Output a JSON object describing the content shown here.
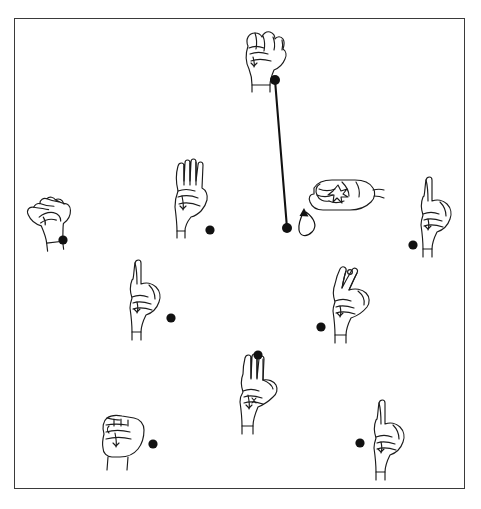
{
  "figure": {
    "header_caption": "",
    "frame": {
      "x": 14,
      "y": 18,
      "width": 451,
      "height": 471,
      "border_color": "#3a3a3a",
      "background": "#ffffff"
    },
    "canvas": {
      "width": 481,
      "height": 509
    },
    "ink_color": "#1b1b1b",
    "dot_color": "#111111",
    "chart_type": "diagram"
  },
  "handshapes": [
    {
      "id": "hand-top-fist",
      "label": "fist-handshape-top",
      "description": "closed fist, fingers curled, thumb across front, palm facing left",
      "shape": "fist",
      "x": 262,
      "y": 52,
      "rotation": 0,
      "dot": {
        "x": 275,
        "y": 80,
        "r": 5.0
      }
    },
    {
      "id": "hand-left-claw",
      "label": "claw-handshape-left",
      "description": "bent curved hand, fingers together and curled forward",
      "shape": "claw",
      "x": 52,
      "y": 215,
      "rotation": -14,
      "dot": {
        "x": 63,
        "y": 240,
        "r": 4.6
      }
    },
    {
      "id": "hand-upper-left-flat",
      "label": "flat-handshape-upper-left",
      "description": "flat open hand, four fingers extended upward, thumb folded in",
      "shape": "flat-b",
      "x": 191,
      "y": 193,
      "rotation": 0,
      "dot": {
        "x": 210,
        "y": 230,
        "r": 4.6
      }
    },
    {
      "id": "hand-right-twist",
      "label": "twisting-handshape-right",
      "description": "horizontal hand with curved rotation arrow and contact star marker",
      "shape": "twist-horizontal",
      "x": 336,
      "y": 192,
      "rotation": 0,
      "dot": null,
      "motion_arrow": true,
      "contact_marker": true
    },
    {
      "id": "hand-right-index",
      "label": "index-handshape-right",
      "description": "index finger extended upward, remaining fingers closed",
      "shape": "index-up",
      "x": 437,
      "y": 215,
      "rotation": 0,
      "dot": {
        "x": 413,
        "y": 245,
        "r": 4.6
      }
    },
    {
      "id": "hand-mid-left-index",
      "label": "index-handshape-mid-left",
      "description": "index finger extended upward, remaining fingers closed",
      "shape": "index-up",
      "x": 146,
      "y": 298,
      "rotation": 0,
      "dot": {
        "x": 171,
        "y": 318,
        "r": 4.6
      }
    },
    {
      "id": "hand-mid-right-two",
      "label": "two-finger-handshape-mid-right",
      "description": "index and middle fingers extended and spread, thumb out",
      "shape": "two-finger",
      "x": 351,
      "y": 300,
      "rotation": 0,
      "dot": {
        "x": 321,
        "y": 327,
        "r": 4.6
      }
    },
    {
      "id": "hand-bottom-three",
      "label": "three-finger-handshape-bottom",
      "description": "three fingers extended upward, thumb and pinky touching",
      "shape": "three-finger",
      "x": 258,
      "y": 392,
      "rotation": 0,
      "dot": {
        "x": 258,
        "y": 355,
        "r": 4.6
      }
    },
    {
      "id": "hand-bottom-left-fist",
      "label": "fist-handshape-bottom-left",
      "description": "closed fist with folded fingers, knuckles forward",
      "shape": "fist-front",
      "x": 120,
      "y": 438,
      "rotation": 0,
      "dot": {
        "x": 153,
        "y": 444,
        "r": 4.6
      }
    },
    {
      "id": "hand-bottom-right-index",
      "label": "index-handshape-bottom-right",
      "description": "index finger extended upward, remaining fingers closed",
      "shape": "index-up",
      "x": 390,
      "y": 438,
      "rotation": 0,
      "dot": {
        "x": 360,
        "y": 443,
        "r": 4.6
      }
    }
  ],
  "connections": [
    {
      "id": "link-top-to-right",
      "label": "connector-line",
      "from": "hand-top-fist",
      "to": "hand-right-twist",
      "from_point": {
        "x": 275,
        "y": 80
      },
      "to_point": {
        "x": 287,
        "y": 228
      },
      "endpoint_dot_radius": 5.0
    }
  ],
  "annotations": {
    "motion_arrow": {
      "label": "rotation-motion-arrow",
      "description": "curved arrow indicating wrist rotation, head pointing up-left",
      "x": 300,
      "y": 200
    },
    "contact_star": {
      "label": "contact-star-marker",
      "description": "star/asterisk contact marker on back of right hand",
      "x": 336,
      "y": 182
    }
  }
}
